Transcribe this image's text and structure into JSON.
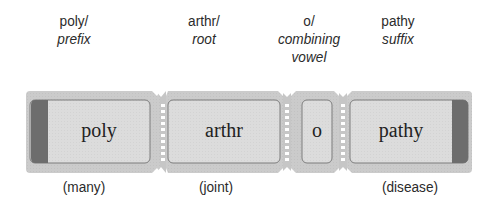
{
  "diagram": {
    "colors": {
      "strip_fill": "#c9c9c9",
      "box_fill": "#dadada",
      "box_border": "#7a7a7a",
      "end_band": "#6e6e6e",
      "perforation": "#ffffff"
    },
    "parts": [
      {
        "word": "poly/",
        "type": "prefix",
        "segment": "poly",
        "meaning": "(many)"
      },
      {
        "word": "arthr/",
        "type": "root",
        "segment": "arthr",
        "meaning": "(joint)"
      },
      {
        "word": "o/",
        "type_line1": "combining",
        "type_line2": "vowel",
        "segment": "o",
        "meaning": ""
      },
      {
        "word": "pathy",
        "type": "suffix",
        "segment": "pathy",
        "meaning": "(disease)"
      }
    ]
  }
}
